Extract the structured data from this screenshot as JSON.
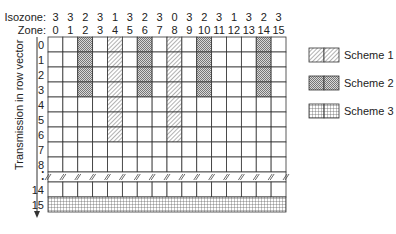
{
  "header": {
    "isozone_label": "Isozone:",
    "zone_label": "Zone:",
    "isozones": [
      "3",
      "3",
      "2",
      "3",
      "1",
      "3",
      "2",
      "3",
      "0",
      "3",
      "2",
      "3",
      "1",
      "3",
      "2",
      "3"
    ],
    "zones": [
      "0",
      "1",
      "2",
      "3",
      "4",
      "5",
      "6",
      "7",
      "8",
      "9",
      "10",
      "11",
      "12",
      "13",
      "14",
      "15"
    ]
  },
  "axis": {
    "title": "Transmission in row vector",
    "row_labels": [
      "0",
      "1",
      "2",
      "3",
      "4",
      "5",
      "6",
      "7",
      "8",
      "•",
      "•",
      "14",
      "15"
    ]
  },
  "grid": {
    "columns": 16,
    "rows": [
      "0",
      "1",
      "2",
      "3",
      "4",
      "5",
      "6",
      "7",
      "8",
      "break",
      "14",
      "15"
    ],
    "scheme1_columns": {
      "4": [
        0,
        1,
        2,
        3,
        4,
        5,
        6
      ],
      "8": [
        0,
        1,
        2,
        3,
        4,
        5,
        6
      ]
    },
    "scheme2_columns": {
      "2": [
        0,
        1,
        2,
        3
      ],
      "6": [
        0,
        1,
        2,
        3
      ],
      "10": [
        0,
        1,
        2,
        3
      ],
      "14": [
        0,
        1,
        2,
        3
      ]
    },
    "scheme3_rows": [
      "15"
    ]
  },
  "legend": {
    "items": [
      {
        "label": "Scheme 1",
        "pattern": "diagonal-hatch"
      },
      {
        "label": "Scheme 2",
        "pattern": "crosshatch-dots"
      },
      {
        "label": "Scheme 3",
        "pattern": "grid"
      }
    ]
  },
  "colors": {
    "line": "#333333",
    "pattern": "#555555",
    "background": "#ffffff"
  }
}
